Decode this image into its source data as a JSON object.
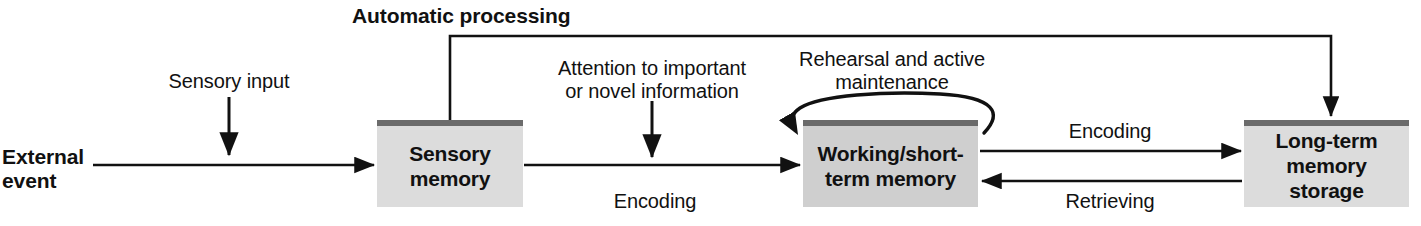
{
  "diagram": {
    "title": "Automatic processing",
    "type": "information-processing-memory-model",
    "canvas": {
      "width": 1421,
      "height": 226,
      "background": "#ffffff"
    },
    "colors": {
      "box_fill_light": "#dcdcdc",
      "box_fill_dark": "#cfcfcf",
      "box_top_bar": "#6b6b6b",
      "stroke": "#111111",
      "text": "#111111"
    },
    "nodes": [
      {
        "id": "sensory-memory",
        "label": "Sensory\nmemory",
        "x": 377,
        "y": 120,
        "width": 146,
        "height": 87,
        "shade": "light"
      },
      {
        "id": "working-short-term-memory",
        "label": "Working/short-\nterm memory",
        "x": 803,
        "y": 120,
        "width": 175,
        "height": 87,
        "shade": "dark"
      },
      {
        "id": "long-term-memory-storage",
        "label": "Long-term\nmemory storage",
        "x": 1244,
        "y": 120,
        "width": 165,
        "height": 87,
        "shade": "light"
      }
    ],
    "labels": [
      {
        "id": "automatic-processing",
        "text": "Automatic processing",
        "x": 352,
        "y": 4,
        "width": 210,
        "bold": true,
        "align": "left"
      },
      {
        "id": "external-event",
        "text": "External\nevent",
        "x": 2,
        "y": 145,
        "width": 86,
        "bold": true,
        "align": "left"
      },
      {
        "id": "sensory-input",
        "text": "Sensory input",
        "x": 158,
        "y": 70,
        "width": 142,
        "bold": false,
        "align": "center"
      },
      {
        "id": "attention-to-important-or-novel-information",
        "text": "Attention to important\nor novel information",
        "x": 532,
        "y": 57,
        "width": 240,
        "bold": false,
        "align": "center"
      },
      {
        "id": "encoding-sensory-to-working",
        "text": "Encoding",
        "x": 600,
        "y": 190,
        "width": 110,
        "bold": false,
        "align": "center"
      },
      {
        "id": "rehearsal-and-active-maintenance",
        "text": "Rehearsal and active\nmaintenance",
        "x": 784,
        "y": 48,
        "width": 216,
        "bold": false,
        "align": "center"
      },
      {
        "id": "encoding-working-to-longterm",
        "text": "Encoding",
        "x": 1055,
        "y": 120,
        "width": 110,
        "bold": false,
        "align": "center"
      },
      {
        "id": "retrieving-longterm-to-working",
        "text": "Retrieving",
        "x": 1050,
        "y": 190,
        "width": 120,
        "bold": false,
        "align": "center"
      }
    ],
    "edges": [
      {
        "id": "external-event-to-sensory-memory",
        "from": "external-event",
        "to": "sensory-memory",
        "kind": "arrow-right"
      },
      {
        "id": "sensory-input-into-flow",
        "from": "sensory-input",
        "to": "external-event-flow",
        "kind": "arrow-down"
      },
      {
        "id": "sensory-memory-to-working-memory",
        "from": "sensory-memory",
        "to": "working-short-term-memory",
        "kind": "arrow-right",
        "label": "Encoding"
      },
      {
        "id": "attention-into-flow",
        "from": "attention-to-important-or-novel-information",
        "to": "encoding-flow",
        "kind": "arrow-down"
      },
      {
        "id": "automatic-processing-sensory-to-longterm",
        "from": "sensory-memory",
        "to": "long-term-memory-storage",
        "kind": "elbow-over-top-arrow-down",
        "label": "Automatic processing"
      },
      {
        "id": "rehearsal-loop",
        "from": "working-short-term-memory",
        "to": "working-short-term-memory",
        "kind": "self-loop",
        "label": "Rehearsal and active maintenance"
      },
      {
        "id": "working-memory-to-long-term",
        "from": "working-short-term-memory",
        "to": "long-term-memory-storage",
        "kind": "arrow-right",
        "label": "Encoding"
      },
      {
        "id": "long-term-to-working-memory",
        "from": "long-term-memory-storage",
        "to": "working-short-term-memory",
        "kind": "arrow-left",
        "label": "Retrieving"
      }
    ]
  }
}
